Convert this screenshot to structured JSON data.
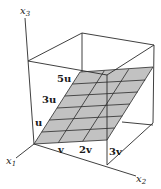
{
  "diagram": {
    "type": "3d-plane-span",
    "axes": {
      "x1": {
        "label": "x",
        "sub": "1"
      },
      "x2": {
        "label": "x",
        "sub": "2"
      },
      "x3": {
        "label": "x",
        "sub": "3"
      }
    },
    "plane_labels": {
      "u": "u",
      "u3": "3u",
      "u5": "5u",
      "v": "v",
      "v2": "2v",
      "v3": "3v"
    },
    "grid": {
      "u_steps": 6,
      "v_steps": 3
    },
    "colors": {
      "plane_fill": "#c2c2c2",
      "line": "#2a2a2a",
      "background": "#ffffff"
    }
  }
}
